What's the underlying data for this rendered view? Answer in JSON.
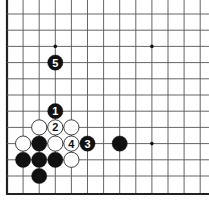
{
  "diagram": {
    "board": {
      "origin_x": 7,
      "origin_y": 14,
      "spacing_x": 16.1,
      "spacing_y": 16.2,
      "columns": 13,
      "rows": 12,
      "left_edge": true,
      "bottom_edge": true,
      "line_color": "#555555",
      "edge_color": "#222222"
    },
    "star_points": [
      {
        "col": 3,
        "row": 2
      },
      {
        "col": 9,
        "row": 2
      },
      {
        "col": 9,
        "row": 8
      }
    ],
    "stones": [
      {
        "color": "black",
        "col": 3,
        "row": 6,
        "label": "1"
      },
      {
        "color": "white",
        "col": 3,
        "row": 7,
        "label": "2"
      },
      {
        "color": "black",
        "col": 5,
        "row": 8,
        "label": "3"
      },
      {
        "color": "white",
        "col": 4,
        "row": 8,
        "label": "4"
      },
      {
        "color": "black",
        "col": 3,
        "row": 3,
        "label": "5"
      },
      {
        "color": "white",
        "col": 2,
        "row": 7,
        "label": ""
      },
      {
        "color": "white",
        "col": 4,
        "row": 7,
        "label": ""
      },
      {
        "color": "white",
        "col": 1,
        "row": 8,
        "label": ""
      },
      {
        "color": "black",
        "col": 2,
        "row": 8,
        "label": ""
      },
      {
        "color": "white",
        "col": 3,
        "row": 8,
        "label": ""
      },
      {
        "color": "black",
        "col": 1,
        "row": 9,
        "label": ""
      },
      {
        "color": "black",
        "col": 2,
        "row": 9,
        "label": ""
      },
      {
        "color": "black",
        "col": 3,
        "row": 9,
        "label": ""
      },
      {
        "color": "white",
        "col": 4,
        "row": 9,
        "label": ""
      },
      {
        "color": "black",
        "col": 2,
        "row": 10,
        "label": ""
      },
      {
        "color": "black",
        "col": 7,
        "row": 8,
        "label": ""
      }
    ]
  }
}
